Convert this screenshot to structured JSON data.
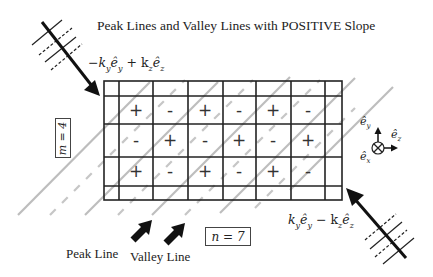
{
  "title": "Peak Lines and Valley Lines with POSITIVE Slope",
  "wave_in_label": "−kᵧêᵧ + kᵩêᵩ",
  "wave_in": {
    "minus": "−k",
    "y1": "y",
    "e": "ê",
    "y2": "y",
    "plus": " + k",
    "z1": "z",
    "z2": "z"
  },
  "wave_out": {
    "k": "k",
    "y1": "y",
    "e": "ê",
    "y2": "y",
    "minus": " − k",
    "z1": "z",
    "z2": "z"
  },
  "m_label": "m = 4",
  "n_label": "n = 7",
  "peak_line_label": "Peak Line",
  "valley_line_label": "Valley Line",
  "axes": {
    "ey": "ê",
    "ey_sub": "y",
    "ez": "ê",
    "ez_sub": "z",
    "ex": "ê",
    "ex_sub": "x"
  },
  "grid": {
    "rows": 3,
    "cols": 6,
    "signs": [
      [
        "+",
        "-",
        "+",
        "-",
        "+",
        "-"
      ],
      [
        "-",
        "+",
        "-",
        "+",
        "-",
        "+"
      ],
      [
        "+",
        "-",
        "+",
        "-",
        "+",
        "-"
      ]
    ]
  },
  "colors": {
    "grid": "#222222",
    "peak_line": "#bbbbbb",
    "valley_line": "#c4c4c4",
    "arrow": "#111111"
  }
}
